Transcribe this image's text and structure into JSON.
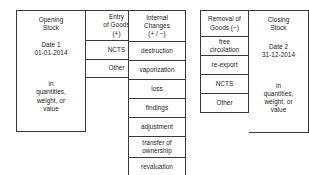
{
  "diagram": {
    "colors": {
      "border": "#3a3a3a",
      "text": "#1c1c1c",
      "background": "#ffffff"
    },
    "groups": [
      {
        "id": "opening",
        "columns": [
          {
            "id": "opening-stock",
            "cells": [
              {
                "id": "title",
                "lines": [
                  "Opening",
                  "Stock"
                ]
              },
              {
                "id": "date",
                "lines": [
                  "Date 1",
                  "01-01-2014"
                ]
              },
              {
                "id": "units",
                "lines": [
                  "in",
                  "quantities,",
                  "weight, or",
                  "value"
                ]
              }
            ]
          },
          {
            "id": "entry-of-goods",
            "cells": [
              {
                "id": "title",
                "lines": [
                  "Entry",
                  "of Goods",
                  "(+)"
                ]
              },
              {
                "id": "ncts",
                "lines": [
                  "NCTS"
                ]
              },
              {
                "id": "other",
                "lines": [
                  "Other"
                ]
              }
            ]
          }
        ]
      },
      {
        "id": "internal",
        "columns": [
          {
            "id": "internal-changes",
            "cells": [
              {
                "id": "title",
                "lines": [
                  "Internal",
                  "Changes",
                  "(+ / −)"
                ]
              },
              {
                "id": "destruction",
                "lines": [
                  "destruction"
                ]
              },
              {
                "id": "vaporization",
                "lines": [
                  "vaporization"
                ]
              },
              {
                "id": "loss",
                "lines": [
                  "loss"
                ]
              },
              {
                "id": "findings",
                "lines": [
                  "findings"
                ]
              },
              {
                "id": "adjustment",
                "lines": [
                  "adjustment"
                ]
              },
              {
                "id": "transfer",
                "lines": [
                  "transfer of",
                  "ownership"
                ]
              },
              {
                "id": "revaluation",
                "lines": [
                  "revaluation"
                ]
              }
            ]
          }
        ]
      },
      {
        "id": "removal",
        "columns": [
          {
            "id": "removal-of-goods",
            "cells": [
              {
                "id": "title",
                "lines": [
                  "Removal of",
                  "Goods (−)"
                ]
              },
              {
                "id": "free-circulation",
                "lines": [
                  "free",
                  "circulation"
                ]
              },
              {
                "id": "re-export",
                "lines": [
                  "re-export"
                ]
              },
              {
                "id": "ncts",
                "lines": [
                  "NCTS"
                ]
              },
              {
                "id": "other",
                "lines": [
                  "Other"
                ]
              }
            ]
          },
          {
            "id": "closing-stock",
            "cells": [
              {
                "id": "title",
                "lines": [
                  "Closing",
                  "Stock"
                ]
              },
              {
                "id": "date",
                "lines": [
                  "Date 2",
                  "31-12-2014"
                ]
              },
              {
                "id": "units",
                "lines": [
                  "in",
                  "quantities,",
                  "weight, or",
                  "value"
                ]
              }
            ]
          }
        ]
      }
    ],
    "text": {
      "opening_title_1": "Opening",
      "opening_title_2": "Stock",
      "opening_date_1": "Date 1",
      "opening_date_2": "01-01-2014",
      "opening_units_1": "in",
      "opening_units_2": "quantities,",
      "opening_units_3": "weight, or",
      "opening_units_4": "value",
      "entry_title_1": "Entry",
      "entry_title_2": "of Goods",
      "entry_title_3": "(+)",
      "entry_ncts": "NCTS",
      "entry_other": "Other",
      "internal_title_1": "Internal",
      "internal_title_2": "Changes",
      "internal_title_3": "(+ / −)",
      "internal_destruction": "destruction",
      "internal_vaporization": "vaporization",
      "internal_loss": "loss",
      "internal_findings": "findings",
      "internal_adjustment": "adjustment",
      "internal_transfer_1": "transfer of",
      "internal_transfer_2": "ownership",
      "internal_revaluation": "revaluation",
      "removal_title_1": "Removal of",
      "removal_title_2": "Goods (−)",
      "removal_free_1": "free",
      "removal_free_2": "circulation",
      "removal_reexport": "re-export",
      "removal_ncts": "NCTS",
      "removal_other": "Other",
      "closing_title_1": "Closing",
      "closing_title_2": "Stock",
      "closing_date_1": "Date 2",
      "closing_date_2": "31-12-2014",
      "closing_units_1": "in",
      "closing_units_2": "quantities,",
      "closing_units_3": "weight, or",
      "closing_units_4": "value"
    }
  }
}
